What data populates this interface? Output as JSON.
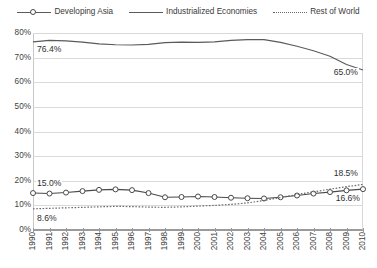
{
  "legend": {
    "items": [
      {
        "label": "Developing Asia",
        "key": "line-marker-key-icon",
        "style": "solid-with-circle-marker",
        "color": "#4a4a4a"
      },
      {
        "label": "Industrialized Economies",
        "key": "line-key-icon",
        "style": "solid",
        "color": "#5a5a5a"
      },
      {
        "label": "Rest of World",
        "key": "dotted-line-key-icon",
        "style": "dotted",
        "color": "#6a6a6a"
      }
    ]
  },
  "axes": {
    "y_ticks": [
      "80%",
      "70%",
      "60%",
      "50%",
      "40%",
      "30%",
      "20%",
      "10%",
      "0%"
    ],
    "x_ticks": [
      "1990",
      "1991",
      "1992",
      "1993",
      "1994",
      "1995",
      "1996",
      "1997",
      "1998",
      "1999",
      "2000",
      "2001",
      "2002",
      "2003",
      "2004",
      "2005",
      "2006",
      "2007",
      "2008",
      "2009",
      "2010"
    ]
  },
  "annotations": [
    {
      "name": "industrialized-start-label",
      "text": "76.4%"
    },
    {
      "name": "industrialized-end-label",
      "text": "65.0%"
    },
    {
      "name": "developing-asia-start-label",
      "text": "15.0%"
    },
    {
      "name": "developing-asia-end-label",
      "text": "16.6%"
    },
    {
      "name": "rest-of-world-start-label",
      "text": "8.6%"
    },
    {
      "name": "rest-of-world-end-label",
      "text": "18.5%"
    }
  ],
  "chart_data": {
    "type": "line",
    "title": "",
    "xlabel": "",
    "ylabel": "",
    "ylim": [
      0,
      80
    ],
    "ytick_step": 10,
    "grid": true,
    "legend_position": "top",
    "x": [
      1990,
      1991,
      1992,
      1993,
      1994,
      1995,
      1996,
      1997,
      1998,
      1999,
      2000,
      2001,
      2002,
      2003,
      2004,
      2005,
      2006,
      2007,
      2008,
      2009,
      2010
    ],
    "series": [
      {
        "name": "Industrialized Economies",
        "style": "solid",
        "color": "#5a5a5a",
        "values": [
          76.4,
          77.0,
          76.8,
          76.3,
          75.6,
          75.2,
          75.1,
          75.4,
          76.1,
          76.3,
          76.2,
          76.4,
          77.0,
          77.3,
          77.3,
          76.2,
          74.6,
          72.8,
          70.6,
          67.2,
          65.0
        ],
        "start_label": "76.4%",
        "end_label": "65.0%"
      },
      {
        "name": "Developing Asia",
        "style": "solid-with-circle-marker",
        "color": "#4a4a4a",
        "values": [
          15.0,
          14.8,
          15.2,
          15.8,
          16.3,
          16.5,
          16.2,
          15.0,
          13.3,
          13.4,
          13.6,
          13.4,
          13.1,
          12.9,
          12.8,
          13.3,
          14.0,
          14.8,
          15.4,
          16.1,
          16.6
        ],
        "start_label": "15.0%",
        "end_label": "16.6%"
      },
      {
        "name": "Rest of World",
        "style": "dotted",
        "color": "#6a6a6a",
        "values": [
          8.6,
          8.8,
          9.0,
          9.2,
          9.4,
          9.6,
          9.5,
          9.3,
          9.2,
          9.4,
          9.7,
          10.0,
          10.4,
          11.0,
          12.0,
          13.2,
          14.4,
          15.5,
          16.6,
          17.6,
          18.5
        ],
        "start_label": "8.6%",
        "end_label": "18.5%"
      }
    ]
  }
}
